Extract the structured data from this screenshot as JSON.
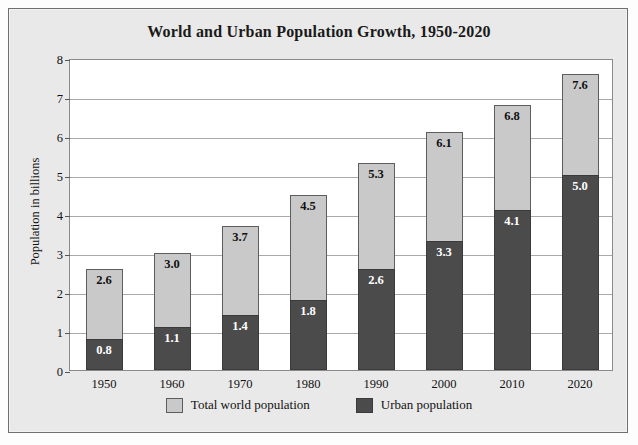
{
  "chart_data": {
    "type": "bar",
    "title": "World and Urban Population Growth, 1950-2020",
    "xlabel": "",
    "ylabel": "Population in billions",
    "categories": [
      "1950",
      "1960",
      "1970",
      "1980",
      "1990",
      "2000",
      "2010",
      "2020"
    ],
    "series": [
      {
        "name": "Total world population",
        "color": "#c9c9c9",
        "values": [
          2.6,
          3.0,
          3.7,
          4.5,
          5.3,
          6.1,
          6.8,
          7.6
        ],
        "labels": [
          "2.6",
          "3.0",
          "3.7",
          "4.5",
          "5.3",
          "6.1",
          "6.8",
          "7.6"
        ]
      },
      {
        "name": "Urban population",
        "color": "#4b4b4b",
        "values": [
          0.8,
          1.1,
          1.4,
          1.8,
          2.6,
          3.3,
          4.1,
          5.0
        ],
        "labels": [
          "0.8",
          "1.1",
          "1.4",
          "1.8",
          "2.6",
          "3.3",
          "4.1",
          "5.0"
        ]
      }
    ],
    "ylim": [
      0,
      8
    ],
    "yticks": [
      "0",
      "1",
      "2",
      "3",
      "4",
      "5",
      "6",
      "7",
      "8"
    ],
    "grid": "horizontal",
    "stacked": "overlay",
    "legend_position": "bottom"
  },
  "legend": {
    "items": [
      {
        "label": "Total world population",
        "swatch": "total"
      },
      {
        "label": "Urban population",
        "swatch": "urban"
      }
    ]
  },
  "caption": {
    "partial_text": ""
  }
}
